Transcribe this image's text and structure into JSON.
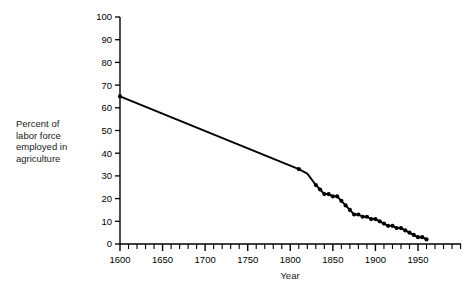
{
  "chart_data": {
    "type": "line",
    "title": "",
    "xlabel": "Year",
    "ylabel": "Percent of labor force employed in agriculture",
    "ylabel_lines": "Percent of\nlabor force\nemployed in\nagriculture",
    "xlim": [
      1590,
      1990
    ],
    "ylim": [
      0,
      100
    ],
    "grid": false,
    "legend": false,
    "marker": "filled-circle",
    "line_color": "#000000",
    "x_major_ticks": [
      1600,
      1650,
      1700,
      1750,
      1800,
      1850,
      1900,
      1950
    ],
    "x_major_tick_labels": [
      "1600",
      "1650",
      "1700",
      "1750",
      "1800",
      "1850",
      "1900",
      "1950"
    ],
    "x_minor_tick_interval": 10,
    "y_ticks": [
      0,
      10,
      20,
      30,
      40,
      50,
      60,
      70,
      80,
      90,
      100
    ],
    "y_tick_labels": [
      "0",
      "10",
      "20",
      "30",
      "40",
      "50",
      "60",
      "70",
      "80",
      "90",
      "100"
    ],
    "series": [
      {
        "name": "Percent of labor force employed in agriculture",
        "points": [
          {
            "x": 1600,
            "y": 65,
            "marker": true
          },
          {
            "x": 1810,
            "y": 33,
            "marker": true
          },
          {
            "x": 1820,
            "y": 31,
            "marker": false
          },
          {
            "x": 1830,
            "y": 26,
            "marker": true
          },
          {
            "x": 1835,
            "y": 24,
            "marker": true
          },
          {
            "x": 1840,
            "y": 22,
            "marker": true
          },
          {
            "x": 1845,
            "y": 22,
            "marker": true
          },
          {
            "x": 1850,
            "y": 21,
            "marker": true
          },
          {
            "x": 1855,
            "y": 21,
            "marker": true
          },
          {
            "x": 1860,
            "y": 19,
            "marker": true
          },
          {
            "x": 1865,
            "y": 17,
            "marker": true
          },
          {
            "x": 1870,
            "y": 15,
            "marker": true
          },
          {
            "x": 1875,
            "y": 13,
            "marker": true
          },
          {
            "x": 1880,
            "y": 13,
            "marker": true
          },
          {
            "x": 1885,
            "y": 12,
            "marker": true
          },
          {
            "x": 1890,
            "y": 12,
            "marker": true
          },
          {
            "x": 1895,
            "y": 11,
            "marker": true
          },
          {
            "x": 1900,
            "y": 11,
            "marker": true
          },
          {
            "x": 1905,
            "y": 10,
            "marker": true
          },
          {
            "x": 1910,
            "y": 9,
            "marker": true
          },
          {
            "x": 1915,
            "y": 8,
            "marker": true
          },
          {
            "x": 1920,
            "y": 8,
            "marker": true
          },
          {
            "x": 1925,
            "y": 7,
            "marker": true
          },
          {
            "x": 1930,
            "y": 7,
            "marker": true
          },
          {
            "x": 1935,
            "y": 6,
            "marker": true
          },
          {
            "x": 1940,
            "y": 5,
            "marker": true
          },
          {
            "x": 1945,
            "y": 4,
            "marker": true
          },
          {
            "x": 1950,
            "y": 3,
            "marker": true
          },
          {
            "x": 1955,
            "y": 3,
            "marker": true
          },
          {
            "x": 1960,
            "y": 2,
            "marker": true
          }
        ]
      }
    ]
  }
}
